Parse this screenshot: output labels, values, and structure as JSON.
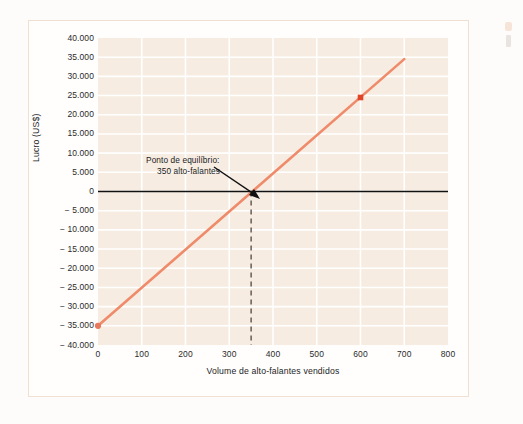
{
  "figure": {
    "background_color": "#fdfcfa",
    "border_color": "#f0e0d2",
    "plot_background_color": "#f6ece1",
    "gridline_color": "#ffffff"
  },
  "annotation": {
    "line1": "Ponto de equilíbrio:",
    "line2": "350 alto-falantes",
    "arrow_color": "#111111"
  },
  "chart_data": {
    "type": "line",
    "title": "",
    "xlabel": "Volume de alto-falantes vendidos",
    "ylabel": "Lucro (US$)",
    "xlim": [
      0,
      800
    ],
    "ylim": [
      -40000,
      40000
    ],
    "grid": true,
    "legend": "none",
    "x_ticks": [
      0,
      100,
      200,
      300,
      400,
      500,
      600,
      700,
      800
    ],
    "x_tick_labels": [
      "0",
      "100",
      "200",
      "300",
      "400",
      "500",
      "600",
      "700",
      "800"
    ],
    "y_ticks": [
      40000,
      35000,
      30000,
      25000,
      20000,
      15000,
      10000,
      5000,
      0,
      -5000,
      -10000,
      -15000,
      -20000,
      -25000,
      -30000,
      -35000,
      -40000
    ],
    "y_tick_labels": [
      "40.000",
      "35.000",
      "30.000",
      "25.000",
      "20.000",
      "15.000",
      "10.000",
      "5.000",
      "0",
      "− 5.000",
      "− 10.000",
      "− 15.000",
      "− 20.000",
      "− 25.000",
      "− 30.000",
      "− 35.000",
      "− 40.000"
    ],
    "series": [
      {
        "name": "Lucro",
        "color": "#ef8b6b",
        "type": "line",
        "x": [
          0,
          700
        ],
        "values": [
          -35000,
          34500
        ],
        "points": [
          {
            "x": 0,
            "y": -35000,
            "marker": "circle",
            "color": "#e8795c"
          },
          {
            "x": 600,
            "y": 24500,
            "marker": "square",
            "color": "#e0452a"
          }
        ]
      },
      {
        "name": "Linha de lucro zero",
        "color": "#111111",
        "type": "hline",
        "y": 0
      },
      {
        "name": "Ponto de equilíbrio",
        "color": "#6b5c52",
        "type": "vline-dashed",
        "x": 350,
        "y_from": 0,
        "y_to": -40000
      }
    ],
    "break_even_units": 350,
    "break_even_label": "350 alto-falantes"
  }
}
